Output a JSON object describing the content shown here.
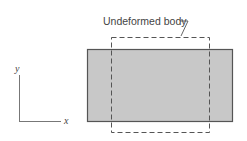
{
  "diagram": {
    "label": "Undeformed body",
    "axis_x_label": "x",
    "axis_y_label": "y",
    "colors": {
      "deformed_fill": "#c8c8c8",
      "deformed_stroke": "#555555",
      "undeformed_stroke": "#555555",
      "axis_stroke": "#777777"
    },
    "deformed_body": {
      "x": 87,
      "y": 49,
      "width": 146,
      "height": 73
    },
    "undeformed_body": {
      "x": 111,
      "y": 37,
      "width": 99,
      "height": 96
    }
  }
}
